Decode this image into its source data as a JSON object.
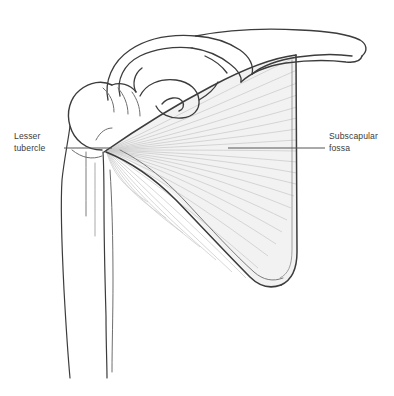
{
  "figure": {
    "background_color": "#ffffff",
    "width": 394,
    "height": 396
  },
  "labels": {
    "lesser_tubercle": {
      "line1": "Lesser",
      "line2": "tubercle"
    },
    "subscapular_fossa": {
      "line1": "Subscapular",
      "line2": "fossa"
    }
  },
  "colors": {
    "outline": "#3c3c3c",
    "outline_light": "#6e6e6e",
    "muscle_fill": "#f2f2f2",
    "muscle_fiber": "#cfcfcf",
    "leader_line": "#555555",
    "text": "#3b3b3b",
    "background": "#ffffff"
  },
  "structures": {
    "clavicle": "clavicle",
    "acromion": "acromion",
    "coracoid_process": "coracoid-process",
    "glenoid": "glenoid-cavity",
    "humerus": "humerus",
    "humeral_head": "humeral-head",
    "greater_tubercle": "greater-tubercle",
    "lesser_tubercle": "lesser-tubercle",
    "intertubercular_groove": "intertubercular-groove",
    "scapula_body": "scapula-body",
    "subscapularis_muscle": "subscapularis-muscle",
    "medial_border": "medial-border",
    "lateral_border": "lateral-border",
    "inferior_angle": "inferior-angle"
  },
  "leader_lines": {
    "left": {
      "x1": 64,
      "y1": 148,
      "x2": 112,
      "y2": 148
    },
    "right": {
      "x1": 228,
      "y1": 148,
      "x2": 325,
      "y2": 148
    }
  },
  "muscle_fibers": {
    "count": 26,
    "origin_x": 106,
    "origin_y": 150,
    "description": "fan of subscapularis fibers converging on lesser tubercle"
  }
}
